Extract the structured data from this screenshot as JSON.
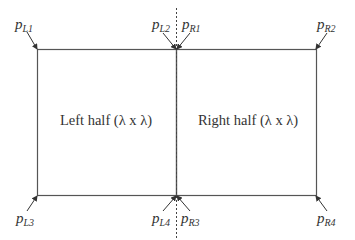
{
  "diagram": {
    "colors": {
      "stroke": "#555555",
      "text": "#333333",
      "background": "#ffffff"
    },
    "regions": {
      "left": {
        "label": "Left half (λ x λ)"
      },
      "right": {
        "label": "Right half (λ x λ)"
      }
    },
    "corner_labels": [
      {
        "id": "pL1",
        "base": "p",
        "sub": "L1"
      },
      {
        "id": "pL2",
        "base": "p",
        "sub": "L2"
      },
      {
        "id": "pR1",
        "base": "p",
        "sub": "R1"
      },
      {
        "id": "pR2",
        "base": "p",
        "sub": "R2"
      },
      {
        "id": "pL3",
        "base": "p",
        "sub": "L3"
      },
      {
        "id": "pL4",
        "base": "p",
        "sub": "L4"
      },
      {
        "id": "pR3",
        "base": "p",
        "sub": "R3"
      },
      {
        "id": "pR4",
        "base": "p",
        "sub": "R4"
      }
    ]
  }
}
